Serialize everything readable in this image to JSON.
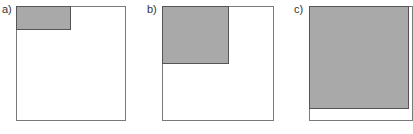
{
  "figure": {
    "panels": [
      {
        "label": "a)",
        "outer_square": "full area",
        "shaded_region": "small top-left rectangle",
        "shaded_fraction_w": 0.49,
        "shaded_fraction_h": 0.2
      },
      {
        "label": "b)",
        "outer_square": "full area",
        "shaded_region": "larger top-left rectangle",
        "shaded_fraction_w": 0.6,
        "shaded_fraction_h": 0.5
      },
      {
        "label": "c)",
        "outer_square": "full area",
        "shaded_region": "nearly full area",
        "shaded_fraction_w": 0.98,
        "shaded_fraction_h": 0.9
      }
    ],
    "colors": {
      "shaded": "#a9a9a9",
      "border": "#7a7a7a",
      "shade_border": "#555555",
      "background": "#ffffff"
    }
  }
}
